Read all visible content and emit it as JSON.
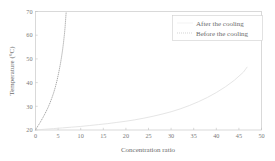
{
  "chart_data": {
    "type": "line",
    "title": "",
    "xlabel": "Concentration ratio",
    "ylabel": "Temperature (°C)",
    "xlim": [
      0,
      50
    ],
    "ylim": [
      20,
      70
    ],
    "xticks": [
      0,
      5,
      10,
      15,
      20,
      25,
      30,
      35,
      40,
      45,
      50
    ],
    "yticks": [
      20,
      30,
      40,
      50,
      60,
      70
    ],
    "xtick_labels": [
      "0",
      "5",
      "10",
      "15",
      "20",
      "25",
      "30",
      "35",
      "40",
      "45",
      "50"
    ],
    "ytick_labels": [
      "20",
      "30",
      "40",
      "50",
      "60",
      "70"
    ],
    "grid": false,
    "legend_position": "top-right",
    "series": [
      {
        "name": "After the cooling",
        "style": "solid",
        "color": "#e2e2e2",
        "x": [
          0,
          2,
          4,
          6,
          8,
          10,
          12,
          14,
          16,
          18,
          20,
          22,
          24,
          26,
          28,
          30,
          32,
          34,
          36,
          38,
          40,
          42,
          44,
          46,
          46.8
        ],
        "y": [
          20.0,
          20.3,
          20.6,
          20.9,
          21.2,
          21.5,
          21.9,
          22.3,
          22.7,
          23.2,
          23.7,
          24.3,
          25.0,
          25.8,
          26.7,
          27.7,
          28.9,
          30.3,
          31.9,
          33.7,
          35.8,
          38.2,
          41.0,
          44.4,
          46.5
        ]
      },
      {
        "name": "Before the cooling",
        "style": "dotted",
        "color": "#9a9a9a",
        "x": [
          0,
          0.2,
          0.4,
          0.7,
          1.0,
          1.3,
          1.6,
          2.0,
          2.4,
          2.8,
          3.2,
          3.6,
          4.0,
          4.4,
          4.8,
          5.2,
          5.5,
          5.8,
          6.0,
          6.2,
          6.4,
          6.55,
          6.7,
          6.8
        ],
        "y": [
          20.0,
          20.6,
          21.3,
          22.2,
          23.1,
          24.1,
          25.1,
          26.5,
          28.0,
          29.6,
          31.4,
          33.4,
          35.6,
          38.2,
          41.2,
          44.8,
          47.8,
          51.3,
          53.9,
          56.9,
          60.4,
          63.5,
          67.6,
          70.0
        ]
      }
    ],
    "legend": [
      {
        "label": "After the cooling",
        "style": "solid",
        "color": "#e2e2e2"
      },
      {
        "label": "Before the cooling",
        "style": "dotted",
        "color": "#9a9a9a"
      }
    ]
  },
  "colors": {
    "background": "#ffffff",
    "frame": "#c9c9c9",
    "text": "#6b6b6b",
    "series_before": "#9a9a9a",
    "series_after": "#e2e2e2"
  }
}
